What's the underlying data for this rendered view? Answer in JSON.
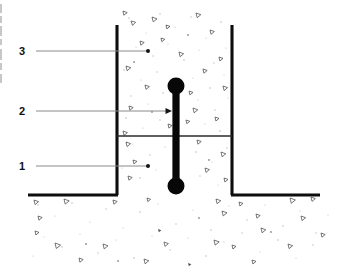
{
  "figure": {
    "background_color": "#ffffff",
    "width": 337,
    "height": 269
  },
  "callouts": [
    {
      "id": "callout-3",
      "label": "3",
      "label_x": 22,
      "label_y": 55,
      "line_y": 51,
      "line_x_start": 36,
      "line_x_end": 148,
      "terminator": "dot",
      "terminator_x": 148
    },
    {
      "id": "callout-2",
      "label": "2",
      "label_x": 22,
      "label_y": 115,
      "line_y": 111,
      "line_x_start": 36,
      "line_x_end": 172,
      "terminator": "arrow",
      "terminator_x": 172
    },
    {
      "id": "callout-1",
      "label": "1",
      "label_x": 22,
      "label_y": 170,
      "line_y": 166,
      "line_x_start": 36,
      "line_x_end": 148,
      "terminator": "dot",
      "terminator_x": 148
    }
  ],
  "structure": {
    "ground_line_y": 195,
    "ground_line_x_start": 28,
    "ground_line_x_end": 320,
    "trench_left_wall_x": 117,
    "trench_right_wall_x": 232,
    "trench_top_y": 25,
    "trench_bottom_y": 195,
    "divider_line_y": 136,
    "divider_x_start": 117,
    "divider_x_end": 232
  },
  "anchor_rod": {
    "center_x": 176,
    "top_bulb_y": 86,
    "bottom_bulb_y": 186,
    "bulb_radius": 8.5,
    "shaft_half_width": 3.6,
    "color": "#080808"
  },
  "colors": {
    "structure_line": "#0d0d0d",
    "divider_line": "#2b2b2b",
    "leader_line": "#8a8a8a",
    "rod": "#080808",
    "aggregate_outline": "#4a4a4a",
    "speckle": "#bdbdbd",
    "label_text": "#111111"
  }
}
